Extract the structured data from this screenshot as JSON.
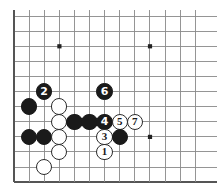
{
  "figure": {
    "kind": "go-board-diagram",
    "title": "",
    "width": 217,
    "height": 194,
    "background_color": "#ffffff"
  },
  "board": {
    "line_color": "#8a8a8a",
    "edge_color": "#555555",
    "star_point_color": "#222222",
    "origin_x": 14,
    "origin_y": 16,
    "spacing": 15.1,
    "cols": 13,
    "rows": 12,
    "left_edge_is_board_border": true,
    "bottom_edge_is_board_border": true,
    "star_points": [
      {
        "col": 3,
        "row": 2
      },
      {
        "col": 9,
        "row": 2
      },
      {
        "col": 9,
        "row": 8
      }
    ]
  },
  "stones": [
    {
      "id": "b-2-5",
      "color": "black",
      "col": 2,
      "row": 5,
      "label": "2"
    },
    {
      "id": "b-6-5",
      "color": "black",
      "col": 6,
      "row": 5,
      "label": "6"
    },
    {
      "id": "b-1-6",
      "color": "black",
      "col": 1,
      "row": 6,
      "label": ""
    },
    {
      "id": "w-3-6",
      "color": "white",
      "col": 3,
      "row": 6,
      "label": ""
    },
    {
      "id": "w-3-7",
      "color": "white",
      "col": 3,
      "row": 7,
      "label": ""
    },
    {
      "id": "b-4-7",
      "color": "black",
      "col": 4,
      "row": 7,
      "label": ""
    },
    {
      "id": "b-5-7",
      "color": "black",
      "col": 5,
      "row": 7,
      "label": ""
    },
    {
      "id": "b-6-7",
      "color": "black",
      "col": 6,
      "row": 7,
      "label": "4"
    },
    {
      "id": "w-7-7",
      "color": "white",
      "col": 7,
      "row": 7,
      "label": "5"
    },
    {
      "id": "w-8-7",
      "color": "white",
      "col": 8,
      "row": 7,
      "label": "7"
    },
    {
      "id": "b-1-8",
      "color": "black",
      "col": 1,
      "row": 8,
      "label": ""
    },
    {
      "id": "b-2-8",
      "color": "black",
      "col": 2,
      "row": 8,
      "label": ""
    },
    {
      "id": "w-3-8",
      "color": "white",
      "col": 3,
      "row": 8,
      "label": ""
    },
    {
      "id": "w-6-8",
      "color": "white",
      "col": 6,
      "row": 8,
      "label": "3"
    },
    {
      "id": "b-7-8",
      "color": "black",
      "col": 7,
      "row": 8,
      "label": ""
    },
    {
      "id": "w-3-9",
      "color": "white",
      "col": 3,
      "row": 9,
      "label": ""
    },
    {
      "id": "w-6-9",
      "color": "white",
      "col": 6,
      "row": 9,
      "label": "1"
    },
    {
      "id": "w-2-10",
      "color": "white",
      "col": 2,
      "row": 10,
      "label": ""
    }
  ],
  "move_sequence": [
    {
      "number": "1",
      "color": "white"
    },
    {
      "number": "2",
      "color": "black"
    },
    {
      "number": "3",
      "color": "white"
    },
    {
      "number": "4",
      "color": "black"
    },
    {
      "number": "5",
      "color": "white"
    },
    {
      "number": "6",
      "color": "black"
    },
    {
      "number": "7",
      "color": "white"
    }
  ]
}
